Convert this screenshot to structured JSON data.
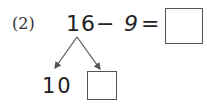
{
  "problem": {
    "label": "(2)",
    "minuend": "16",
    "operator": "−",
    "subtrahend": "9",
    "equals": "=",
    "answer": ""
  },
  "decomposition": {
    "left_part": "10",
    "right_part": ""
  }
}
